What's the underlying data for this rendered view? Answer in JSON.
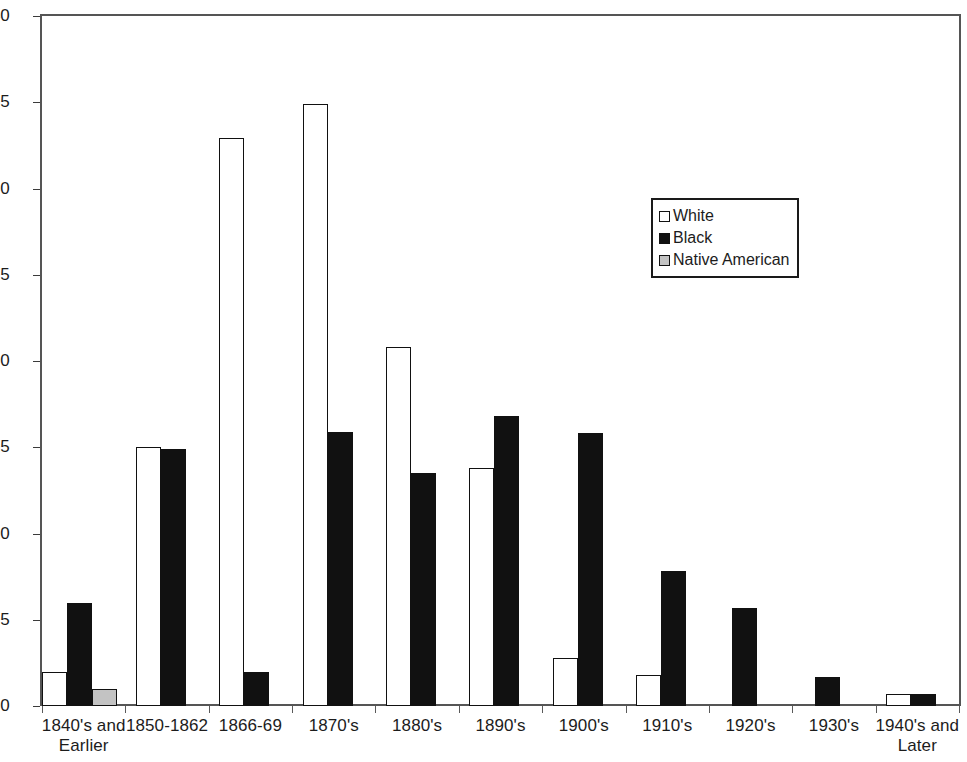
{
  "chart_data": {
    "type": "bar",
    "title": "",
    "subtitle": "",
    "xlabel": "",
    "ylabel": "",
    "ylim": [
      0,
      40
    ],
    "y_ticks": [
      0,
      5,
      10,
      15,
      20,
      25,
      30,
      35,
      40
    ],
    "grid": false,
    "legend_position": "inside-upper-right",
    "categories": [
      "1840's and Earlier",
      "1850-1862",
      "1866-69",
      "1870's",
      "1880's",
      "1890's",
      "1900's",
      "1910's",
      "1920's",
      "1930's",
      "1940's and Later"
    ],
    "series": [
      {
        "name": "White",
        "color": "#ffffff",
        "values": [
          2.0,
          15.0,
          32.9,
          34.9,
          20.8,
          13.8,
          2.8,
          1.8,
          0,
          0,
          0.7
        ]
      },
      {
        "name": "Black",
        "color": "#111111",
        "values": [
          6.0,
          14.9,
          2.0,
          15.9,
          13.5,
          16.8,
          15.8,
          7.8,
          5.7,
          1.7,
          0.7
        ]
      },
      {
        "name": "Native American",
        "color": "#c3c3c3",
        "values": [
          1.0,
          0,
          0,
          0,
          0,
          0,
          0,
          0,
          0,
          0,
          0
        ]
      }
    ]
  },
  "legend": {
    "entries": [
      {
        "label": "White",
        "swatch": "white"
      },
      {
        "label": "Black",
        "swatch": "black"
      },
      {
        "label": "Native American",
        "swatch": "native"
      }
    ]
  }
}
